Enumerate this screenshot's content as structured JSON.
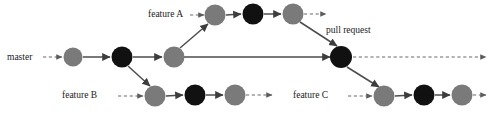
{
  "diagram": {
    "type": "git-branch-diagram",
    "background_color": "#ffffff",
    "colors": {
      "node_gray": "#7a7a7a",
      "node_black": "#111111",
      "line_solid": "#4d4d4d",
      "line_dashed": "#6b6b6b",
      "text": "#1a1a1a"
    },
    "labels": {
      "master": "master",
      "feature_a": "feature A",
      "feature_b": "feature B",
      "feature_c": "feature C",
      "pull_request": "pull request"
    },
    "branches": [
      {
        "id": "master",
        "label": "master",
        "label_x": 7,
        "label_y": 60,
        "lane_y": 57,
        "lead_in_dash": {
          "x1": 43,
          "x2": 62
        },
        "nodes": [
          {
            "id": "m1",
            "cx": 73,
            "cy": 57,
            "r": 9.5,
            "color": "node_gray"
          },
          {
            "id": "m2",
            "cx": 122,
            "cy": 57,
            "r": 10.5,
            "color": "node_black"
          },
          {
            "id": "m3",
            "cx": 174,
            "cy": 57,
            "r": 10.5,
            "color": "node_gray"
          }
        ],
        "tail_solid": {
          "x1": 184,
          "x2": 330
        }
      },
      {
        "id": "featureA",
        "label": "feature A",
        "label_x": 148,
        "label_y": 17,
        "lane_y": 15,
        "lead_in_dash": {
          "x1": 190,
          "x2": 204
        },
        "nodes": [
          {
            "id": "a1",
            "cx": 215,
            "cy": 15,
            "r": 10.5,
            "color": "node_gray"
          },
          {
            "id": "a2",
            "cx": 253,
            "cy": 14,
            "r": 10.5,
            "color": "node_black"
          },
          {
            "id": "a3",
            "cx": 293,
            "cy": 14,
            "r": 10.5,
            "color": "node_gray"
          }
        ],
        "tail_dash": {
          "x1": 304,
          "x2": 326
        }
      },
      {
        "id": "featureB",
        "label": "feature B",
        "label_x": 62,
        "label_y": 98,
        "lane_y": 96,
        "lead_in_dash": {
          "x1": 118,
          "x2": 143
        },
        "nodes": [
          {
            "id": "b1",
            "cx": 155,
            "cy": 96,
            "r": 10.5,
            "color": "node_gray"
          },
          {
            "id": "b2",
            "cx": 195,
            "cy": 95,
            "r": 10.5,
            "color": "node_black"
          },
          {
            "id": "b3",
            "cx": 235,
            "cy": 95,
            "r": 10.5,
            "color": "node_gray"
          }
        ],
        "tail_dash": {
          "x1": 246,
          "x2": 272
        }
      },
      {
        "id": "featureC",
        "label": "feature C",
        "label_x": 293,
        "label_y": 98,
        "lane_y": 96,
        "lead_in_dash": {
          "x1": 348,
          "x2": 372
        },
        "nodes": [
          {
            "id": "c1",
            "cx": 384,
            "cy": 96,
            "r": 10.5,
            "color": "node_gray"
          },
          {
            "id": "c2",
            "cx": 424,
            "cy": 95,
            "r": 10.5,
            "color": "node_black"
          },
          {
            "id": "c3",
            "cx": 462,
            "cy": 95,
            "r": 10.5,
            "color": "node_gray"
          }
        ],
        "tail_dash": {
          "x1": 473,
          "x2": 486
        }
      }
    ],
    "merge_node": {
      "id": "merge",
      "label": "pull request",
      "label_x": 326,
      "label_y": 33,
      "cx": 341,
      "cy": 57,
      "r": 11,
      "color": "node_black",
      "tail_dash": {
        "x1": 353,
        "x2": 486
      }
    },
    "connectors": [
      {
        "id": "master-to-featureB",
        "from": "m2",
        "to": "b1",
        "x1": 128,
        "y1": 66,
        "x2": 150,
        "y2": 86,
        "style": "solid"
      },
      {
        "id": "master-to-featureA",
        "from": "m3",
        "to": "a1",
        "x1": 180,
        "y1": 48,
        "x2": 208,
        "y2": 24,
        "style": "solid"
      },
      {
        "id": "featureA-to-merge",
        "from": "a3",
        "to": "merge",
        "x1": 300,
        "y1": 22,
        "x2": 337,
        "y2": 46,
        "style": "solid"
      },
      {
        "id": "merge-to-featureC",
        "from": "merge",
        "to": "c1",
        "x1": 347,
        "y1": 67,
        "x2": 379,
        "y2": 87,
        "style": "solid"
      }
    ]
  }
}
